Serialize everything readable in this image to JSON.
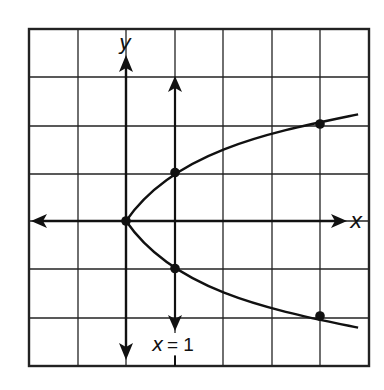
{
  "figure": {
    "type": "parabola-graph",
    "equation_plotted": "x = y^2",
    "axis_labels": {
      "x": "x",
      "y": "y"
    },
    "line_label": "x = 1",
    "line_label_var": "x",
    "line_label_eq": "= 1",
    "grid": {
      "columns": 7,
      "rows": 7,
      "x_range": [
        -2,
        5
      ],
      "y_range": [
        -3,
        4
      ]
    },
    "points": [
      {
        "x": 0,
        "y": 0
      },
      {
        "x": 1,
        "y": 1
      },
      {
        "x": 1,
        "y": -1
      },
      {
        "x": 4,
        "y": 2
      },
      {
        "x": 4,
        "y": -2
      }
    ],
    "colors": {
      "ink": "#111111",
      "background": "#ffffff"
    }
  }
}
